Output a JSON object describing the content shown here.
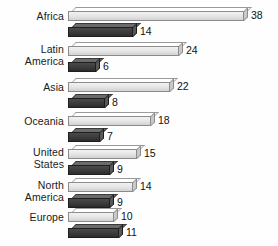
{
  "chart_data": {
    "type": "bar",
    "title": "",
    "subtitle": "",
    "xlabel": "",
    "ylabel": "",
    "orientation": "horizontal",
    "grid": false,
    "legend_position": "none",
    "axis_visible": false,
    "xlim": [
      0,
      38
    ],
    "categories": [
      "Africa",
      "Latin America",
      "Asia",
      "Oceania",
      "United States",
      "North America",
      "Europe"
    ],
    "series": [
      {
        "name": "light",
        "color": "#e4e4e4",
        "values": [
          38,
          24,
          22,
          18,
          15,
          14,
          10
        ]
      },
      {
        "name": "dark",
        "color": "#3b3b3b",
        "values": [
          14,
          6,
          8,
          7,
          9,
          9,
          11
        ]
      }
    ]
  },
  "colors": {
    "background": "#fefefe",
    "light_bar": "#e4e4e4",
    "light_bar_top": "#ffffff",
    "light_bar_side": "#c9c9c9",
    "light_bar_border": "#8c8c8c",
    "dark_bar": "#3b3b3b",
    "dark_bar_top": "#6b6b6b",
    "dark_bar_side": "#585858",
    "dark_bar_border": "#1e1e1e",
    "text": "#1a1a1a"
  },
  "groups": [
    {
      "label": "Africa",
      "label_lines": [
        "Africa"
      ],
      "light_value": "38",
      "dark_value": "14"
    },
    {
      "label": "Latin America",
      "label_lines": [
        "Latin",
        "America"
      ],
      "light_value": "24",
      "dark_value": "6"
    },
    {
      "label": "Asia",
      "label_lines": [
        "Asia"
      ],
      "light_value": "22",
      "dark_value": "8"
    },
    {
      "label": "Oceania",
      "label_lines": [
        "Oceania"
      ],
      "light_value": "18",
      "dark_value": "7"
    },
    {
      "label": "United States",
      "label_lines": [
        "United",
        "States"
      ],
      "light_value": "15",
      "dark_value": "9"
    },
    {
      "label": "North America",
      "label_lines": [
        "North",
        "America"
      ],
      "light_value": "14",
      "dark_value": "9"
    },
    {
      "label": "Europe",
      "label_lines": [
        "Europe"
      ],
      "light_value": "10",
      "dark_value": "11"
    }
  ]
}
